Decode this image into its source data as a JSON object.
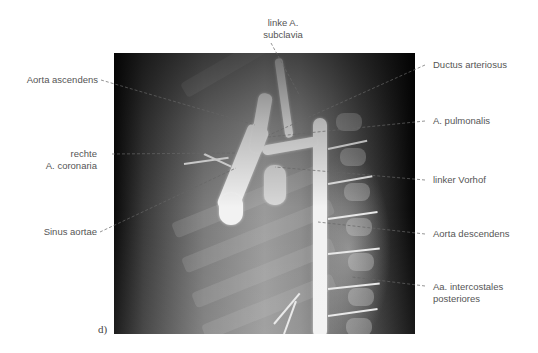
{
  "figure": {
    "panel_letter": "d)",
    "image_description": "angiography-x-ray-thoracic-aorta"
  },
  "labels": {
    "top": {
      "line1": "linke A.",
      "line2": "subclavia"
    },
    "left": [
      {
        "id": "aorta-ascendens",
        "line1": "Aorta ascendens"
      },
      {
        "id": "rechte-a-coronaria",
        "line1": "rechte",
        "line2": "A. coronaria"
      },
      {
        "id": "sinus-aortae",
        "line1": "Sinus aortae"
      }
    ],
    "right": [
      {
        "id": "ductus-arteriosus",
        "line1": "Ductus arteriosus"
      },
      {
        "id": "a-pulmonalis",
        "line1": "A. pulmonalis"
      },
      {
        "id": "linker-vorhof",
        "line1": "linker Vorhof"
      },
      {
        "id": "aorta-descendens",
        "line1": "Aorta descendens"
      },
      {
        "id": "aa-intercostales",
        "line1": "Aa. intercostales",
        "line2": "posteriores"
      }
    ]
  }
}
